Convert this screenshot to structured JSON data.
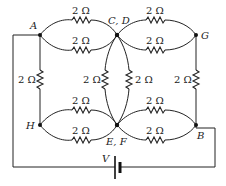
{
  "diagram": {
    "type": "circuit",
    "nodes": {
      "A": "A",
      "CD": "C, D",
      "G": "G",
      "H": "H",
      "EF": "E, F",
      "B": "B"
    },
    "battery_label": "V",
    "resistors": [
      {
        "id": "r_AC_top",
        "from": "A",
        "to": "C,D",
        "label": "2 Ω"
      },
      {
        "id": "r_AC_bot",
        "from": "A",
        "to": "C,D",
        "label": "2 Ω"
      },
      {
        "id": "r_CG_top",
        "from": "C,D",
        "to": "G",
        "label": "2 Ω"
      },
      {
        "id": "r_CG_bot",
        "from": "C,D",
        "to": "G",
        "label": "2 Ω"
      },
      {
        "id": "r_AH",
        "from": "A",
        "to": "H",
        "label": "2 Ω"
      },
      {
        "id": "r_CE_left",
        "from": "C,D",
        "to": "E,F",
        "label": "2 Ω"
      },
      {
        "id": "r_CE_right",
        "from": "C,D",
        "to": "E,F",
        "label": "2 Ω"
      },
      {
        "id": "r_GB",
        "from": "G",
        "to": "B",
        "label": "2 Ω"
      },
      {
        "id": "r_HE_top",
        "from": "H",
        "to": "E,F",
        "label": "2 Ω"
      },
      {
        "id": "r_HE_bot",
        "from": "H",
        "to": "E,F",
        "label": "2 Ω"
      },
      {
        "id": "r_EB_top",
        "from": "E,F",
        "to": "B",
        "label": "2 Ω"
      },
      {
        "id": "r_EB_bot",
        "from": "E,F",
        "to": "B",
        "label": "2 Ω"
      }
    ]
  }
}
